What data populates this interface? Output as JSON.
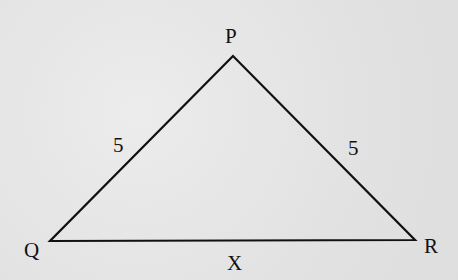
{
  "diagram": {
    "type": "triangle",
    "vertices": {
      "P": {
        "label": "P",
        "x": 233,
        "y": 56
      },
      "Q": {
        "label": "Q",
        "x": 50,
        "y": 241
      },
      "R": {
        "label": "R",
        "x": 415,
        "y": 240
      }
    },
    "sides": {
      "PQ": {
        "label": "5"
      },
      "PR": {
        "label": "5"
      },
      "QR": {
        "label": "X"
      }
    },
    "stroke_color": "#111111",
    "background_color": "#e4e4e4"
  }
}
